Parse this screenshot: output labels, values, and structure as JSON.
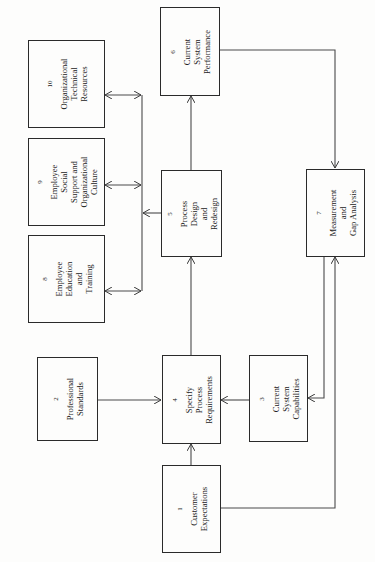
{
  "diagram": {
    "orientation": "rotated-90-ccw",
    "line_color": "#4a4a4a",
    "boxes": [
      {
        "id": "1",
        "number": "1",
        "label": "Customer\nExpectations"
      },
      {
        "id": "2",
        "number": "2",
        "label": "Professional\nStandards"
      },
      {
        "id": "3",
        "number": "3",
        "label": "Current System\nCapabilities"
      },
      {
        "id": "4",
        "number": "4",
        "label": "Specify Process\nRequirements"
      },
      {
        "id": "5",
        "number": "5",
        "label": "Process Design and\nRedesign"
      },
      {
        "id": "6",
        "number": "6",
        "label": "Current System\nPerformance"
      },
      {
        "id": "7",
        "number": "7",
        "label": "Measurement and\nGap Analysis"
      },
      {
        "id": "8",
        "number": "8",
        "label": "Employee\nEducation and\nTraining"
      },
      {
        "id": "9",
        "number": "9",
        "label": "Employee Social\nSupport and\nOrganizational\nCulture"
      },
      {
        "id": "10",
        "number": "10",
        "label": "Organizational\nTechnical\nResources"
      }
    ],
    "edges": [
      {
        "from": "1",
        "to": "4",
        "type": "arrow"
      },
      {
        "from": "2",
        "to": "4",
        "type": "arrow"
      },
      {
        "from": "3",
        "to": "4",
        "type": "arrow"
      },
      {
        "from": "4",
        "to": "5",
        "type": "arrow"
      },
      {
        "from": "5",
        "to": "6",
        "type": "arrow"
      },
      {
        "from": "5",
        "to": "bus",
        "type": "arrow"
      },
      {
        "from": "bus",
        "to": "8",
        "type": "bidirectional"
      },
      {
        "from": "bus",
        "to": "9",
        "type": "bidirectional"
      },
      {
        "from": "bus",
        "to": "10",
        "type": "bidirectional"
      },
      {
        "from": "6",
        "to": "7",
        "type": "arrow"
      },
      {
        "from": "1",
        "to": "7",
        "type": "arrow"
      },
      {
        "from": "7",
        "to": "3",
        "type": "arrow"
      }
    ]
  }
}
